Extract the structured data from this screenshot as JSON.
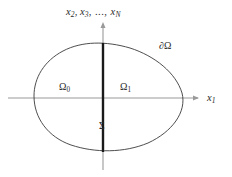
{
  "figure": {
    "type": "mathematical-diagram",
    "background_color": "#ffffff"
  },
  "axes": {
    "horizontal": {
      "label": "x",
      "label_subscript": "1",
      "color": "#9a9a9a",
      "arrow": "right",
      "x_start": 8,
      "x_end": 200,
      "y": 98
    },
    "vertical": {
      "label_base": "x",
      "label_sub_1": "2",
      "label_base_2": "x",
      "label_sub_2": "3",
      "label_dots": ", ..., ",
      "label_base_3": "x",
      "label_sub_3": "N",
      "label_full": "x2, x3, ..., xN",
      "color": "#9a9a9a",
      "arrow": "up",
      "x": 103,
      "y_start": 170,
      "y_end": 22
    }
  },
  "regions": {
    "boundary": {
      "label": "∂Ω",
      "name": "boundary-of-omega",
      "stroke_color": "#3a3a3a",
      "stroke_width": 0.9,
      "fill": "none"
    },
    "left_subdomain": {
      "label_base": "Ω",
      "label_subscript": "0",
      "name": "omega-zero"
    },
    "right_subdomain": {
      "label_base": "Ω",
      "label_subscript": "1",
      "name": "omega-one"
    },
    "interface": {
      "label": "Σ",
      "name": "sigma-interface",
      "stroke_color": "#1a1a1a",
      "stroke_width": 2.4,
      "x": 103,
      "y_top": 43,
      "y_bottom": 152
    }
  },
  "chart_data": {
    "type": "line",
    "title": "",
    "xlabel": "x_1",
    "ylabel": "x_2, x_3, ..., x_N",
    "grid": false,
    "legend": "none",
    "xlim": [
      8,
      200
    ],
    "ylim": [
      170,
      22
    ],
    "annotations": [
      {
        "text": "∂Ω",
        "x": 163,
        "y": 47
      },
      {
        "text": "Ω_0",
        "x": 64,
        "y": 90
      },
      {
        "text": "Ω_1",
        "x": 125,
        "y": 90
      },
      {
        "text": "Σ",
        "x": 104,
        "y": 128
      },
      {
        "text": "x_1",
        "x": 212,
        "y": 99
      },
      {
        "text": "x_2, x_3, ..., x_N",
        "x": 96,
        "y": 13
      }
    ],
    "series": [
      {
        "name": "boundary-curve",
        "closed": true,
        "points": [
          [
            34,
            96
          ],
          [
            35,
            82
          ],
          [
            41,
            69
          ],
          [
            52,
            57
          ],
          [
            68,
            48
          ],
          [
            86,
            44
          ],
          [
            104,
            43
          ],
          [
            124,
            46
          ],
          [
            145,
            54
          ],
          [
            163,
            66
          ],
          [
            176,
            80
          ],
          [
            182,
            95
          ],
          [
            180,
            110
          ],
          [
            170,
            126
          ],
          [
            153,
            140
          ],
          [
            131,
            149
          ],
          [
            107,
            152
          ],
          [
            84,
            150
          ],
          [
            64,
            143
          ],
          [
            48,
            130
          ],
          [
            38,
            114
          ],
          [
            34,
            96
          ]
        ]
      },
      {
        "name": "sigma-segment",
        "closed": false,
        "points": [
          [
            103,
            43
          ],
          [
            103,
            152
          ]
        ]
      }
    ]
  }
}
